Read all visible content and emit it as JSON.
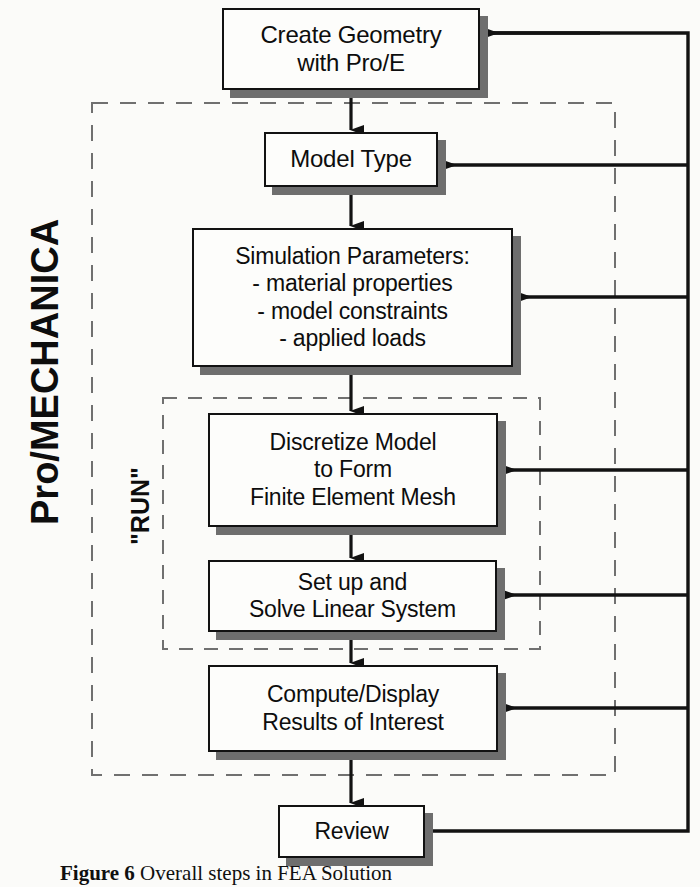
{
  "figure": {
    "caption_label": "Figure 6",
    "caption_text": "Overall steps in FEA Solution"
  },
  "groups": [
    {
      "id": "pro-mechanica",
      "label": "Pro/MECHANICA",
      "style": "dashed"
    },
    {
      "id": "run",
      "label": "\"RUN\"",
      "style": "dashed"
    }
  ],
  "nodes": [
    {
      "id": "create-geometry",
      "text": "Create Geometry\nwith Pro/E"
    },
    {
      "id": "model-type",
      "text": "Model Type"
    },
    {
      "id": "simulation-parameters",
      "text": "Simulation Parameters:\n - material properties\n - model constraints\n - applied loads"
    },
    {
      "id": "discretize-model",
      "text": "Discretize Model\nto Form\nFinite Element Mesh"
    },
    {
      "id": "solve-linear-system",
      "text": "Set up and\nSolve Linear System"
    },
    {
      "id": "compute-display-results",
      "text": "Compute/Display\nResults of Interest"
    },
    {
      "id": "review",
      "text": "Review"
    }
  ],
  "colors": {
    "stroke": "#121212",
    "shadow": "#6e6e6e",
    "dashed": "#707070",
    "fill": "#fdfdfb",
    "background": "#fbfbf9"
  }
}
